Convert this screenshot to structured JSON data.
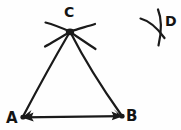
{
  "figure": {
    "background_color": "#fefefe",
    "ink_color": "#1a1a1a",
    "labels": {
      "a": "A",
      "b": "B",
      "c": "C",
      "d": "D"
    },
    "label_positions": {
      "a": {
        "x": 6,
        "y": 123
      },
      "b": {
        "x": 126,
        "y": 121
      },
      "c": {
        "x": 65,
        "y": 16
      },
      "d": {
        "x": 166,
        "y": 25
      }
    },
    "vertices": {
      "a": {
        "x": 22,
        "y": 117
      },
      "b": {
        "x": 122,
        "y": 116
      },
      "c": {
        "x": 70,
        "y": 31
      }
    },
    "segments": [
      {
        "name": "segment-ac",
        "from": "A",
        "to": "C",
        "arrow_at": "A"
      },
      {
        "name": "segment-cb",
        "from": "C",
        "to": "B",
        "arrow_at": "B"
      },
      {
        "name": "segment-ab",
        "from": "A",
        "to": "B",
        "arrow_at": "both"
      }
    ],
    "construction_marks": {
      "at_c": {
        "name": "arc-crossing-at-c",
        "description": "two compass arcs intersecting at vertex C",
        "stroke_count": 4
      },
      "at_d": {
        "name": "arc-crossing-at-d",
        "description": "two compass arcs intersecting at point D",
        "stroke_count": 2
      }
    },
    "stroke_width": 2.1,
    "label_font_size": 15
  }
}
